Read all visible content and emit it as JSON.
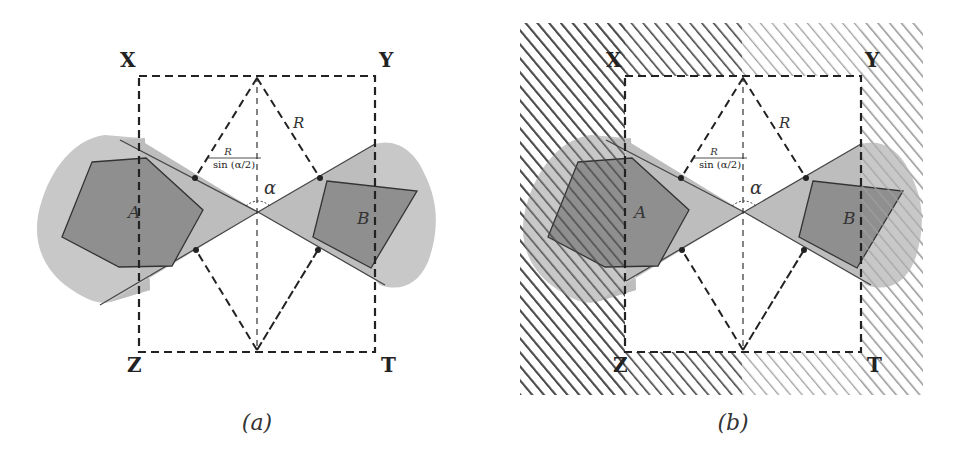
{
  "panels": [
    {
      "id": "a",
      "caption": "(a)",
      "corners": {
        "top_left": "X",
        "top_right": "Y",
        "bottom_left": "Z",
        "bottom_right": "T"
      },
      "objects": {
        "left": "A",
        "right": "B"
      },
      "labels": {
        "radius": "R",
        "frac_numerator": "R",
        "frac_denominator": "sin (α/2)",
        "angle": "α"
      }
    },
    {
      "id": "b",
      "caption": "(b)",
      "corners": {
        "top_left": "X",
        "top_right": "Y",
        "bottom_left": "Z",
        "bottom_right": "T"
      },
      "objects": {
        "left": "A",
        "right": "B"
      },
      "labels": {
        "radius": "R",
        "frac_numerator": "R",
        "frac_denominator": "sin (α/2)",
        "angle": "α"
      }
    }
  ],
  "colors": {
    "blob": "#c8c8c8",
    "cone": "#bdbdbd",
    "polygon": "#8f8f8f",
    "stroke": "#333333",
    "hatch_dark": "#444444",
    "hatch_light": "#9a9a9a"
  }
}
